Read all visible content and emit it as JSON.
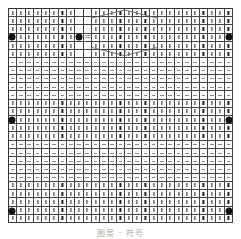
{
  "chart": {
    "columns": 27,
    "rows": 26,
    "bands": [
      {
        "symbol": "knit",
        "glyph": "|",
        "rows": [
          0,
          1,
          2,
          3,
          4,
          5
        ]
      },
      {
        "symbol": "purl",
        "glyph": "—",
        "rows": [
          6,
          7,
          8,
          9,
          10
        ]
      },
      {
        "symbol": "knit",
        "glyph": "|",
        "rows": [
          11,
          12,
          13,
          14,
          15
        ]
      },
      {
        "symbol": "purl",
        "glyph": "—",
        "rows": [
          16,
          17,
          18,
          19,
          20
        ]
      },
      {
        "symbol": "knit",
        "glyph": "|",
        "rows": [
          21,
          22,
          23,
          24,
          25
        ]
      }
    ],
    "markers": [
      {
        "type": "dot",
        "row": 3,
        "col": 0
      },
      {
        "type": "dot",
        "row": 3,
        "col": 8
      },
      {
        "type": "dot",
        "row": 3,
        "col": 26
      },
      {
        "type": "dot",
        "row": 13,
        "col": 0
      },
      {
        "type": "dot",
        "row": 13,
        "col": 26
      },
      {
        "type": "dot",
        "row": 24,
        "col": 0
      },
      {
        "type": "dot",
        "row": 24,
        "col": 26
      }
    ],
    "legend": {
      "symbol": "dot",
      "equals": "=",
      "blank_cols": [
        8,
        9
      ],
      "blank_rows": [
        0,
        1,
        2,
        3,
        4,
        5
      ]
    },
    "cable": {
      "label": "cable cross",
      "col_start": 10,
      "col_end": 17,
      "row_start": 0,
      "row_end": 5,
      "marker": "7"
    },
    "colors": {
      "grid": "#444444",
      "knit": "#222222",
      "purl": "#888888",
      "dot": "#111111"
    }
  },
  "caption": "图案 · 符号"
}
